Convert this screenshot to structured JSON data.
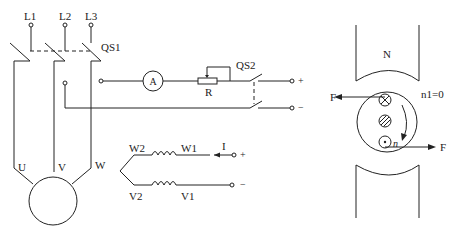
{
  "circuit": {
    "lines": [
      "L1",
      "L2",
      "L3"
    ],
    "switch1": "QS1",
    "switch2": "QS2",
    "ammeter": "A",
    "resistor": "R",
    "dc_plus": "+",
    "dc_minus": "−",
    "motor_terminals": [
      "U",
      "V",
      "W"
    ]
  },
  "winding": {
    "labels": {
      "w2": "W2",
      "w1": "W1",
      "v2": "V2",
      "v1": "V1"
    },
    "current": "I",
    "plus": "+",
    "minus": "−"
  },
  "magnet": {
    "north": "N",
    "force_left": "F",
    "force_right": "F",
    "speed_label": "n1=0",
    "rotation": "n"
  }
}
